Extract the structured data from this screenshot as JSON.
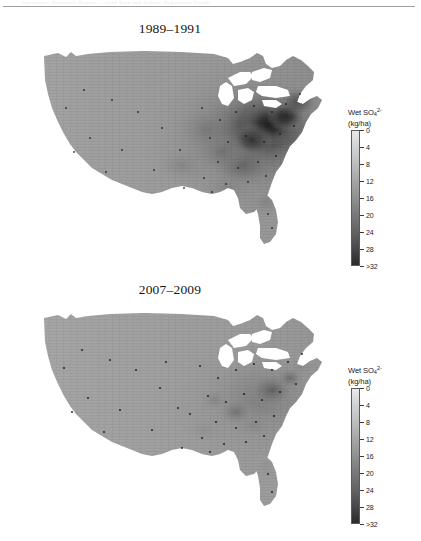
{
  "page": {
    "scan_header_ghost": "Interactive Scientific Report — Acid Rain and Sulfate Deposition Trends",
    "background_color": "#ffffff",
    "width": 421,
    "height": 541
  },
  "panels": [
    {
      "id": "panel-1989",
      "title": "1989–1991",
      "map_name": "wet-sulfate-deposition-map-1989-1991",
      "legend": {
        "title_main": "Wet SO",
        "title_sub": "4",
        "title_sup": "2-",
        "units": "(kg/ha)",
        "ticks": [
          "0",
          "4",
          "8",
          "12",
          "16",
          "20",
          "24",
          "28",
          ">32"
        ],
        "gradient_light": "#e9e9e9",
        "gradient_dark": "#2a2a2a"
      }
    },
    {
      "id": "panel-2007",
      "title": "2007–2009",
      "map_name": "wet-sulfate-deposition-map-2007-2009",
      "legend": {
        "title_main": "Wet SO",
        "title_sub": "4",
        "title_sup": "2-",
        "units": "(kg/ha)",
        "ticks": [
          "0",
          "4",
          "8",
          "12",
          "16",
          "20",
          "24",
          "28",
          ">32"
        ],
        "gradient_light": "#e9e9e9",
        "gradient_dark": "#2a2a2a"
      }
    }
  ],
  "chart_data": {
    "type": "heatmap",
    "subtitle": "Comparison of two three-year averaging periods",
    "variable": "Wet SO4 2- deposition",
    "unit": "kg/ha",
    "colorbar": {
      "ticks": [
        0,
        4,
        8,
        12,
        16,
        20,
        24,
        28,
        32
      ],
      "tick_labels": [
        "0",
        "4",
        "8",
        "12",
        "16",
        "20",
        "24",
        "28",
        ">32"
      ],
      "range": [
        0,
        32
      ],
      "orientation": "vertical",
      "low_color": "#e9e9e9",
      "high_color": "#2a2a2a",
      "scale_note": "light = low deposition, dark = high deposition"
    },
    "projection": "contiguous United States (Albers-like)",
    "grid": false,
    "legend_position": "right of each map",
    "panels": [
      {
        "name": "1989-1991",
        "period_start": 1989,
        "period_end": 1991,
        "regional_values": [
          {
            "region": "Pacific Northwest",
            "value": 4
          },
          {
            "region": "California",
            "value": 3
          },
          {
            "region": "Great Basin / Nevada",
            "value": 3
          },
          {
            "region": "Southwest / Arizona",
            "value": 3
          },
          {
            "region": "Northern Rockies / Montana",
            "value": 4
          },
          {
            "region": "Northern Plains / Dakotas",
            "value": 6
          },
          {
            "region": "Central Plains / Kansas",
            "value": 8
          },
          {
            "region": "Texas",
            "value": 7
          },
          {
            "region": "Upper Midwest / Minnesota",
            "value": 12
          },
          {
            "region": "Wisconsin",
            "value": 18
          },
          {
            "region": "Illinois / Indiana",
            "value": 24
          },
          {
            "region": "Ohio Valley",
            "value": 32
          },
          {
            "region": "Western Pennsylvania",
            "value": 32
          },
          {
            "region": "West Virginia",
            "value": 30
          },
          {
            "region": "New York",
            "value": 26
          },
          {
            "region": "New England",
            "value": 20
          },
          {
            "region": "Mid-Atlantic Coast",
            "value": 22
          },
          {
            "region": "Southeast / Georgia",
            "value": 16
          },
          {
            "region": "Florida",
            "value": 12
          },
          {
            "region": "Gulf Coast / Louisiana",
            "value": 12
          }
        ],
        "peak_value": 32,
        "peak_location": "Ohio Valley / western Pennsylvania"
      },
      {
        "name": "2007-2009",
        "period_start": 2007,
        "period_end": 2009,
        "regional_values": [
          {
            "region": "Pacific Northwest",
            "value": 3
          },
          {
            "region": "California",
            "value": 2
          },
          {
            "region": "Great Basin / Nevada",
            "value": 2
          },
          {
            "region": "Southwest / Arizona",
            "value": 2
          },
          {
            "region": "Northern Rockies / Montana",
            "value": 3
          },
          {
            "region": "Northern Plains / Dakotas",
            "value": 4
          },
          {
            "region": "Central Plains / Kansas",
            "value": 6
          },
          {
            "region": "Texas",
            "value": 6
          },
          {
            "region": "Upper Midwest / Minnesota",
            "value": 7
          },
          {
            "region": "Wisconsin",
            "value": 9
          },
          {
            "region": "Illinois / Indiana",
            "value": 12
          },
          {
            "region": "Ohio Valley",
            "value": 16
          },
          {
            "region": "Western Pennsylvania",
            "value": 17
          },
          {
            "region": "West Virginia",
            "value": 16
          },
          {
            "region": "New York",
            "value": 12
          },
          {
            "region": "New England",
            "value": 9
          },
          {
            "region": "Mid-Atlantic Coast",
            "value": 11
          },
          {
            "region": "Southeast / Georgia",
            "value": 10
          },
          {
            "region": "Florida",
            "value": 8
          },
          {
            "region": "Gulf Coast / Louisiana",
            "value": 8
          }
        ],
        "peak_value": 17,
        "peak_location": "Ohio Valley / western Pennsylvania"
      }
    ]
  }
}
